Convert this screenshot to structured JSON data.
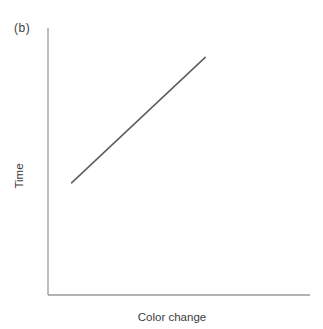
{
  "chart_data": {
    "type": "line",
    "panel_label": "(b)",
    "title": "",
    "xlabel": "Color change",
    "ylabel": "Time",
    "x_axis": {
      "range": [
        0,
        1
      ],
      "ticks": [],
      "tick_labels": [],
      "grid": false
    },
    "y_axis": {
      "range": [
        0,
        1
      ],
      "ticks": [],
      "tick_labels": [],
      "grid": false
    },
    "legend": "none",
    "series": [
      {
        "name": "time-vs-color-change",
        "style": "solid",
        "trend": "linear-increasing",
        "points_norm": [
          {
            "x": 0.09,
            "y": 0.42
          },
          {
            "x": 0.6,
            "y": 0.89
          }
        ]
      }
    ],
    "colors": {
      "background": "#ffffff",
      "axis": "#9a9a9a",
      "line": "#5c5c5c",
      "text": "#3c3c3c"
    }
  }
}
